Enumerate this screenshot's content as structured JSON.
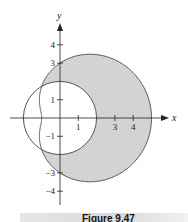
{
  "figure": {
    "caption": "Figure 9.47",
    "colors": {
      "shaded_region": "#d3d3d3",
      "curve": "#555555",
      "axis": "#222222"
    }
  },
  "axes": {
    "x_label": "x",
    "y_label": "y",
    "x_ticks": [
      {
        "value": 1,
        "label": "1"
      },
      {
        "value": 3,
        "label": "3"
      },
      {
        "value": 4,
        "label": "4"
      }
    ],
    "y_ticks": [
      {
        "value": 4,
        "label": "4"
      },
      {
        "value": 3,
        "label": "3"
      },
      {
        "value": 1,
        "label": "1"
      },
      {
        "value": -1,
        "label": "−1"
      },
      {
        "value": -3,
        "label": "−3"
      },
      {
        "value": -4,
        "label": "−4"
      }
    ]
  },
  "curves": [
    {
      "name": "circle",
      "equation": "r = 2"
    },
    {
      "name": "limacon",
      "equation": "r = 3 + 2cosθ"
    }
  ],
  "shaded": "region inside r = 3 + 2cosθ and outside r = 2"
}
